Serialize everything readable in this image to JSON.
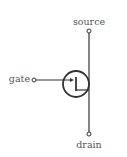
{
  "diagram": {
    "type": "transistor-symbol",
    "terminals": {
      "gate": "gate",
      "source": "source",
      "drain": "drain"
    },
    "colors": {
      "stroke": "#333333",
      "text": "#555555",
      "background": "#ffffff"
    }
  }
}
